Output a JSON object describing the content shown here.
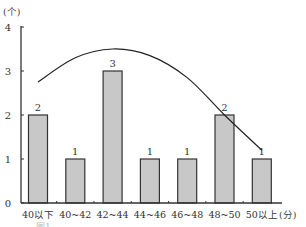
{
  "chart_data": {
    "type": "bar",
    "title": "",
    "xlabel": "(分)",
    "ylabel": "(个)",
    "categories": [
      "40以下",
      "40~42",
      "42~44",
      "44~46",
      "46~48",
      "48~50",
      "50以上"
    ],
    "values": [
      2,
      1,
      3,
      1,
      1,
      2,
      1
    ],
    "data_labels": [
      "2",
      "1",
      "3",
      "1",
      "1",
      "2",
      "1"
    ],
    "ylim": [
      0,
      4
    ],
    "yticks": [
      0,
      1,
      2,
      3,
      4
    ],
    "ytick_labels": [
      "0",
      "1",
      "2",
      "3",
      "4"
    ],
    "grid": false,
    "overlay_curve": {
      "type": "line",
      "description": "smooth normal-like curve",
      "points": [
        {
          "x_index": 0,
          "y": 2.75
        },
        {
          "x_index": 1,
          "y": 3.3
        },
        {
          "x_index": 2,
          "y": 3.5
        },
        {
          "x_index": 3,
          "y": 3.35
        },
        {
          "x_index": 4,
          "y": 2.85
        },
        {
          "x_index": 5,
          "y": 2.0
        },
        {
          "x_index": 6,
          "y": 1.2
        }
      ]
    },
    "colors": {
      "bar_fill": "#c8c8c8",
      "bar_stroke": "#333333",
      "axis": "#333333",
      "curve": "#222222"
    },
    "caption": "图1 …"
  }
}
